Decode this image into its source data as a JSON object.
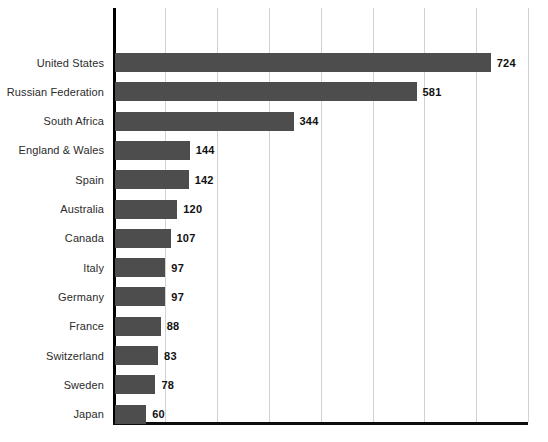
{
  "chart": {
    "type": "bar",
    "orientation": "horizontal",
    "bar_color": "#4d4d4d",
    "value_label_color": "#111111",
    "category_label_color": "#2b2b2b",
    "axis_color": "#000000",
    "gridline_color": "#d2d2d2",
    "background": "#ffffff"
  },
  "chart_data": {
    "type": "bar",
    "orientation": "horizontal",
    "title": "",
    "subtitle": "",
    "xlabel": "",
    "ylabel": "",
    "categories": [
      "United States",
      "Russian Federation",
      "South Africa",
      "England & Wales",
      "Spain",
      "Australia",
      "Canada",
      "Italy",
      "Germany",
      "France",
      "Switzerland",
      "Sweden",
      "Japan"
    ],
    "values": [
      724,
      581,
      344,
      144,
      142,
      120,
      107,
      97,
      97,
      88,
      83,
      78,
      60
    ],
    "data_labels": [
      "724",
      "581",
      "344",
      "144",
      "142",
      "120",
      "107",
      "97",
      "97",
      "88",
      "83",
      "78",
      "60"
    ],
    "xlim": [
      0,
      800
    ],
    "gridlines_x": [
      100,
      200,
      300,
      400,
      500,
      600,
      700,
      800
    ],
    "grid": true,
    "legend": false,
    "legend_position": "none",
    "tick_labels_x": [],
    "tick_labels_y": [
      "United States",
      "Russian Federation",
      "South Africa",
      "England & Wales",
      "Spain",
      "Australia",
      "Canada",
      "Italy",
      "Germany",
      "France",
      "Switzerland",
      "Sweden",
      "Japan"
    ],
    "annotations": []
  }
}
